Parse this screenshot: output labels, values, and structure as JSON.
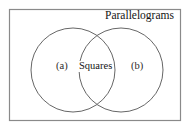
{
  "figure": {
    "type": "venn-diagram",
    "universe_label": "Parallelograms",
    "background_color": "#ffffff",
    "border_color": "#8a8a8a",
    "circle_stroke_color": "#555555",
    "text_color": "#1a1a1a",
    "sets": [
      {
        "id": "left",
        "label": "(a)"
      },
      {
        "id": "right",
        "label": "(b)"
      }
    ],
    "intersection": {
      "label": "Squares"
    }
  }
}
